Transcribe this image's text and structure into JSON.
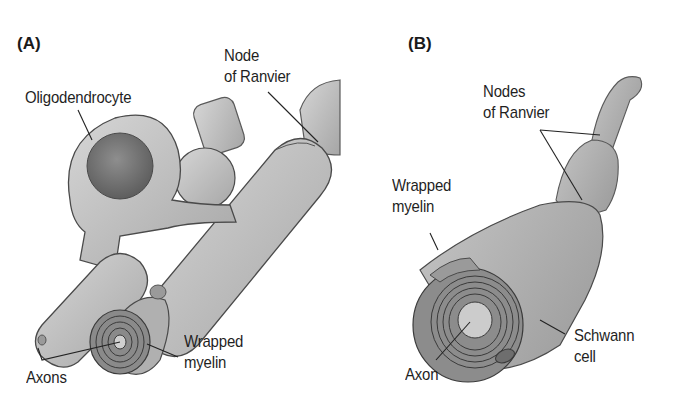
{
  "figure": {
    "panels": [
      {
        "id": "A",
        "label": "(A)",
        "labels": {
          "oligodendrocyte": "Oligodendrocyte",
          "node_line1": "Node",
          "node_line2": "of Ranvier",
          "wrapped_line1": "Wrapped",
          "wrapped_line2": "myelin",
          "axons": "Axons"
        }
      },
      {
        "id": "B",
        "label": "(B)",
        "labels": {
          "nodes_line1": "Nodes",
          "nodes_line2": "of Ranvier",
          "wrapped_line1": "Wrapped",
          "wrapped_line2": "myelin",
          "schwann_line1": "Schwann",
          "schwann_line2": "cell",
          "axon": "Axon"
        }
      }
    ],
    "colors": {
      "background": "#ffffff",
      "tissue_light": "#c8c8c8",
      "tissue_mid": "#a9a9a9",
      "tissue_dark": "#7e7e7e",
      "outline": "#4a4a4a",
      "text": "#1f1f1f"
    }
  }
}
